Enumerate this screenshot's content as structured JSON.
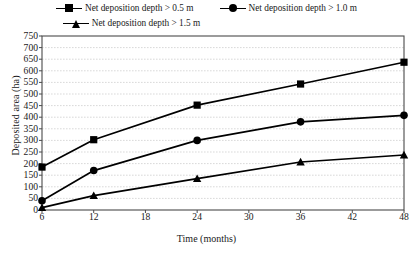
{
  "chart_data": {
    "type": "line",
    "title": "",
    "xlabel": "Time (months)",
    "ylabel": "Deposited area (ha)",
    "x": [
      6,
      12,
      24,
      36,
      48
    ],
    "xlim": [
      6,
      48
    ],
    "ylim": [
      0,
      750
    ],
    "xticks": [
      6,
      12,
      18,
      24,
      30,
      36,
      42,
      48
    ],
    "yticks": [
      0,
      50,
      100,
      150,
      200,
      250,
      300,
      350,
      400,
      450,
      500,
      550,
      600,
      650,
      700,
      750
    ],
    "grid": "horizontal",
    "legend_position": "top",
    "series": [
      {
        "name": "Net deposition depth > 0.5 m",
        "marker": "square",
        "color": "#000000",
        "values": [
          185,
          303,
          452,
          543,
          637
        ]
      },
      {
        "name": "Net deposition depth > 1.0 m",
        "marker": "circle",
        "color": "#000000",
        "values": [
          40,
          170,
          300,
          380,
          408
        ]
      },
      {
        "name": "Net deposition depth > 1.5 m",
        "marker": "triangle",
        "color": "#000000",
        "values": [
          10,
          62,
          135,
          207,
          237
        ]
      }
    ]
  },
  "legend": {
    "items": [
      {
        "label": "Net deposition depth > 0.5 m",
        "marker": "square"
      },
      {
        "label": "Net deposition depth > 1.0 m",
        "marker": "circle"
      },
      {
        "label": "Net deposition depth > 1.5 m",
        "marker": "triangle"
      }
    ]
  },
  "colors": {
    "series": "#000000",
    "grid": "#c9c9c9",
    "frame": "#4a4a4a",
    "background": "#ffffff"
  }
}
